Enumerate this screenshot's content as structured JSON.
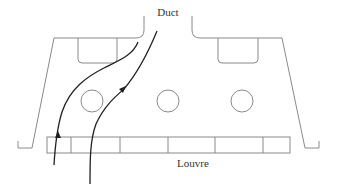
{
  "diagram": {
    "labels": {
      "duct": "Duct",
      "louvre": "Louvre"
    },
    "colors": {
      "outline": "#8a8a8a",
      "flow": "#222222",
      "text": "#333333",
      "background": "#ffffff"
    },
    "components": {
      "housing": "trapezoidal enclosure with duct opening at top",
      "baffles": 2,
      "circles": 3,
      "louvre_segments": 6,
      "airflow_arrows": 2
    }
  }
}
